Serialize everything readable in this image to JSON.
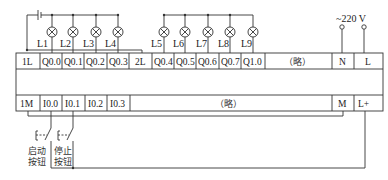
{
  "diagram": {
    "type": "PLC wiring diagram",
    "supply": {
      "label": "~220 V",
      "terminals": [
        "N",
        "L"
      ]
    },
    "output_row": {
      "cells": [
        "1L",
        "Q0.0",
        "Q0.1",
        "Q0.2",
        "Q0.3",
        "2L",
        "Q0.4",
        "Q0.5",
        "Q0.6",
        "Q0.7",
        "Q1.0",
        "（略）",
        "N",
        "L"
      ]
    },
    "input_row": {
      "cells": [
        "1M",
        "I0.0",
        "I0.1",
        "I0.2",
        "I0.3",
        "（略）",
        "M",
        "L+"
      ]
    },
    "lamps": [
      {
        "label": "L1",
        "terminal": "Q0.0"
      },
      {
        "label": "L2",
        "terminal": "Q0.1"
      },
      {
        "label": "L3",
        "terminal": "Q0.2"
      },
      {
        "label": "L4",
        "terminal": "Q0.3"
      },
      {
        "label": "L5",
        "terminal": "Q0.4"
      },
      {
        "label": "L6",
        "terminal": "Q0.5"
      },
      {
        "label": "L7",
        "terminal": "Q0.6"
      },
      {
        "label": "L8",
        "terminal": "Q0.7"
      },
      {
        "label": "L9",
        "terminal": "Q1.0"
      }
    ],
    "buttons": [
      {
        "label_line1": "启动",
        "label_line2": "按钮",
        "terminal": "I0.0"
      },
      {
        "label_line1": "停止",
        "label_line2": "按钮",
        "terminal": "I0.1"
      }
    ]
  }
}
